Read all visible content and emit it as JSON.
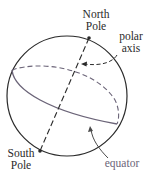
{
  "diagram": {
    "labels": {
      "north_pole": [
        "North",
        "Pole"
      ],
      "polar_axis": [
        "polar",
        "axis"
      ],
      "south_pole": [
        "South",
        "Pole"
      ],
      "equator": "equator"
    },
    "colors": {
      "outline": "#2a2a2a",
      "equator": "#6b6478",
      "text": "#2a2a2a"
    }
  }
}
